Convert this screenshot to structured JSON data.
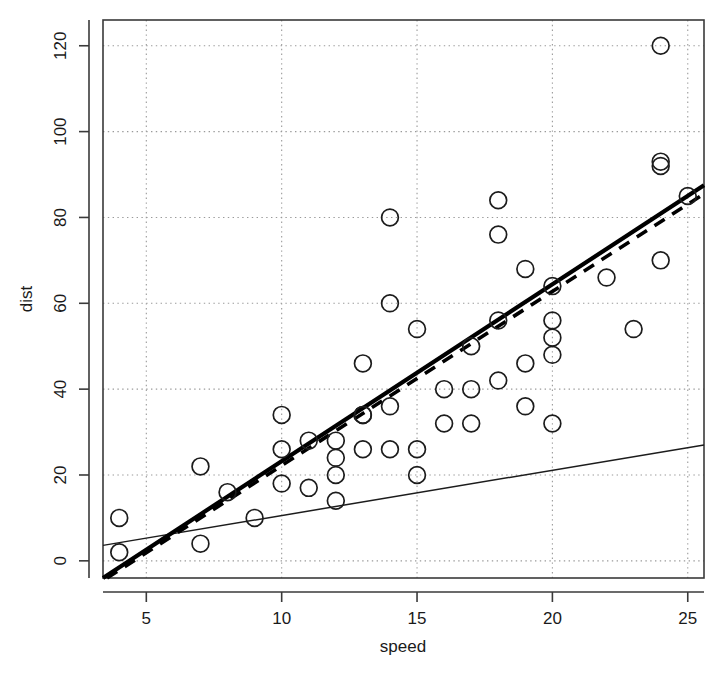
{
  "chart_data": {
    "type": "scatter",
    "title": "",
    "xlabel": "speed",
    "ylabel": "dist",
    "xlim": [
      3.4,
      25.6
    ],
    "ylim": [
      -4,
      126
    ],
    "xticks": [
      5,
      10,
      15,
      20,
      25
    ],
    "yticks": [
      0,
      20,
      40,
      60,
      80,
      100,
      120
    ],
    "xtick_labels": [
      "5",
      "10",
      "15",
      "20",
      "25"
    ],
    "ytick_labels": [
      "0",
      "20",
      "40",
      "60",
      "80",
      "100",
      "120"
    ],
    "grid": "dotted grey gridlines at every tick, both axes",
    "legend": "none",
    "point_marker": "open circle",
    "x": [
      4,
      4,
      7,
      7,
      8,
      9,
      10,
      10,
      10,
      11,
      11,
      12,
      12,
      12,
      12,
      13,
      13,
      13,
      13,
      14,
      14,
      14,
      14,
      15,
      15,
      15,
      16,
      16,
      17,
      17,
      17,
      18,
      18,
      18,
      18,
      19,
      19,
      19,
      20,
      20,
      20,
      20,
      20,
      22,
      23,
      24,
      24,
      24,
      24,
      25
    ],
    "y": [
      2,
      10,
      4,
      22,
      16,
      10,
      18,
      26,
      34,
      17,
      28,
      14,
      20,
      24,
      28,
      26,
      34,
      34,
      46,
      26,
      36,
      60,
      80,
      20,
      26,
      54,
      32,
      40,
      32,
      40,
      50,
      42,
      56,
      76,
      84,
      36,
      46,
      68,
      32,
      48,
      52,
      56,
      64,
      66,
      54,
      70,
      92,
      93,
      120,
      85
    ],
    "series": [
      {
        "name": "points",
        "label": "dist vs speed observations",
        "n": 50
      }
    ],
    "fit_lines": [
      {
        "name": "regression-line-thick",
        "style": "solid-thick",
        "x0": 3.4,
        "y0": -4,
        "x1": 25.6,
        "y1": 87.5
      },
      {
        "name": "regression-line-dashed",
        "style": "dashed",
        "x0": 3.55,
        "y0": -4,
        "x1": 25.6,
        "y1": 85.5
      },
      {
        "name": "reference-line-thin",
        "style": "solid-thin",
        "x0": 3.4,
        "y0": 3.6,
        "x1": 25.6,
        "y1": 27.0
      }
    ]
  },
  "geometry": {
    "plot_left": 103,
    "plot_right": 704,
    "plot_top": 20,
    "plot_bottom": 578
  },
  "axes": {
    "x_axis_name": "speed-axis",
    "y_axis_name": "dist-axis"
  }
}
